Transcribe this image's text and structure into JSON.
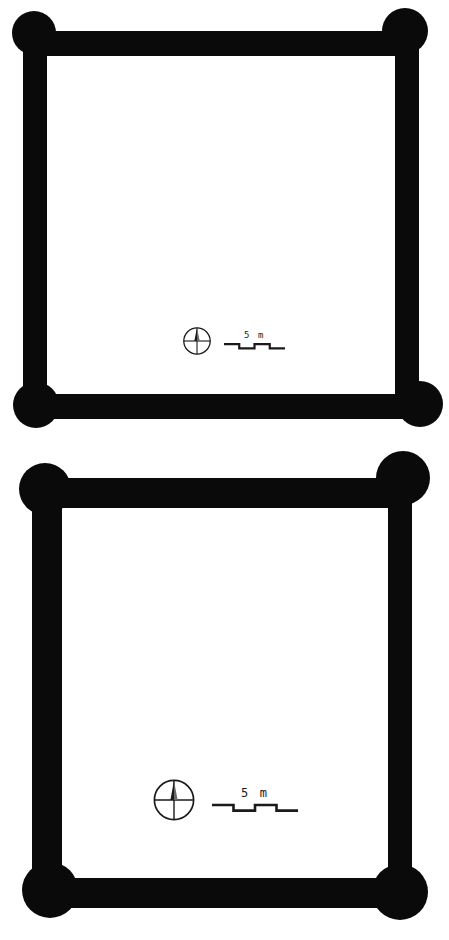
{
  "document": {
    "type": "archaeological-site-plan",
    "background_color": "#ffffff",
    "ink_color": "#0a0a0a",
    "figure_count": 2
  },
  "figures": [
    {
      "id": "plan-upper",
      "name": "upper-structure-plan",
      "shape": "rectangular enclosure with circular corner posts",
      "outline": {
        "left": 23,
        "top": 31,
        "right": 419,
        "bottom": 419,
        "wall_thickness": 25
      },
      "corner_posts": [
        {
          "name": "post-northwest",
          "cx": 34,
          "cy": 33,
          "r": 22
        },
        {
          "name": "post-northeast",
          "cx": 405,
          "cy": 31,
          "r": 23
        },
        {
          "name": "post-southwest",
          "cx": 36,
          "cy": 405,
          "r": 23
        },
        {
          "name": "post-southeast",
          "cx": 420,
          "cy": 404,
          "r": 23
        }
      ],
      "north_arrow": {
        "label": "north-arrow",
        "style": "circle-with-crosshair-and-needle",
        "diameter_px": 30
      },
      "scale_bar": {
        "label": "5 m",
        "value": 5,
        "unit": "m",
        "style": "alternating-step-bar",
        "segments": 4,
        "length_px": 61
      }
    },
    {
      "id": "plan-lower",
      "name": "lower-structure-plan",
      "shape": "rectangular enclosure with circular corner posts",
      "outline": {
        "left": 32,
        "top": 478,
        "right": 412,
        "bottom": 893,
        "wall_thickness": 30
      },
      "corner_posts": [
        {
          "name": "post-northwest",
          "cx": 45,
          "cy": 489,
          "r": 26
        },
        {
          "name": "post-northeast",
          "cx": 403,
          "cy": 478,
          "r": 27
        },
        {
          "name": "post-southwest",
          "cx": 50,
          "cy": 890,
          "r": 28
        },
        {
          "name": "post-southeast",
          "cx": 400,
          "cy": 892,
          "r": 28
        }
      ],
      "north_arrow": {
        "label": "north-arrow",
        "style": "circle-with-crosshair-and-needle",
        "diameter_px": 44
      },
      "scale_bar": {
        "label": "5 m",
        "value": 5,
        "unit": "m",
        "style": "alternating-step-bar",
        "segments": 4,
        "length_px": 86
      }
    }
  ]
}
